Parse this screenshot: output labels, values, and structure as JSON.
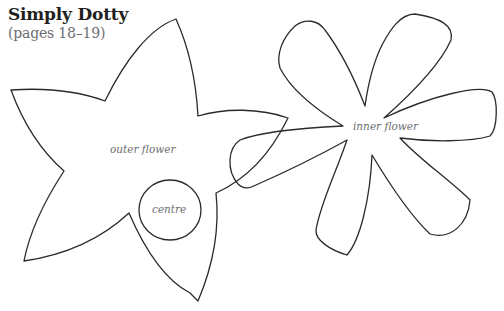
{
  "header": {
    "title": "Simply Dotty",
    "subtitle": "(pages 18–19)"
  },
  "shapes": [
    {
      "id": "outer-flower",
      "label": "outer flower",
      "petals": 5
    },
    {
      "id": "centre",
      "label": "centre",
      "form": "circle"
    },
    {
      "id": "inner-flower",
      "label": "inner flower",
      "petals": 7
    }
  ],
  "colors": {
    "stroke": "#2b2b2b",
    "title": "#231f20",
    "subtitle": "#6d6e71",
    "label": "#6d6e71",
    "background": "#ffffff"
  }
}
